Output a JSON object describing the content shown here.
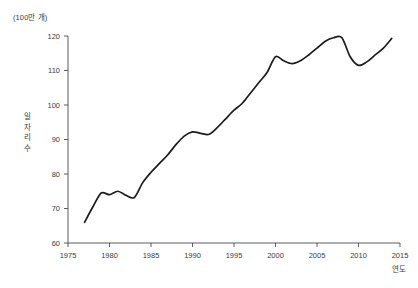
{
  "chart_data": {
    "type": "line",
    "title": "",
    "subtitle": "",
    "unit_label": "(100만 개)",
    "ylabel": "일자리\n수",
    "ylabel_plain": "일자리 수",
    "xlabel": "연도",
    "xlim": [
      1975,
      2015
    ],
    "ylim": [
      60,
      120
    ],
    "grid": false,
    "legend": "none",
    "y_ticks": [
      120,
      110,
      100,
      90,
      80,
      70,
      60
    ],
    "y_tick_labels": [
      "120",
      "110",
      "100",
      "90",
      "80",
      "70",
      "60"
    ],
    "x_ticks": [
      1975,
      1980,
      1985,
      1990,
      1995,
      2000,
      2005,
      2010,
      2015
    ],
    "x_tick_labels": [
      "1975",
      "1980",
      "1985",
      "1990",
      "1995",
      "2000",
      "2005",
      "2010",
      "2015"
    ],
    "series": [
      {
        "name": "일자리 수",
        "color": "#1c1c1c",
        "x": [
          1977,
          1978,
          1979,
          1980,
          1981,
          1982,
          1983,
          1984,
          1985,
          1986,
          1987,
          1988,
          1989,
          1990,
          1991,
          1992,
          1993,
          1994,
          1995,
          1996,
          1997,
          1998,
          1999,
          2000,
          2001,
          2002,
          2003,
          2004,
          2005,
          2006,
          2007,
          2008,
          2009,
          2010,
          2011,
          2012,
          2013,
          2014
        ],
        "values": [
          66.0,
          70.5,
          74.5,
          74.0,
          75.0,
          73.8,
          73.2,
          77.5,
          80.5,
          83.0,
          85.5,
          88.5,
          91.0,
          92.2,
          91.8,
          91.5,
          93.5,
          96.0,
          98.5,
          100.5,
          103.5,
          106.5,
          109.5,
          114.0,
          112.8,
          112.0,
          112.8,
          114.5,
          116.5,
          118.5,
          119.5,
          119.5,
          114.0,
          111.5,
          112.5,
          114.5,
          116.5,
          119.3
        ]
      }
    ],
    "annotations": []
  },
  "axes": {
    "unit_label": "(100만 개)",
    "y_title": "일자리\n수",
    "x_title": "연도"
  }
}
